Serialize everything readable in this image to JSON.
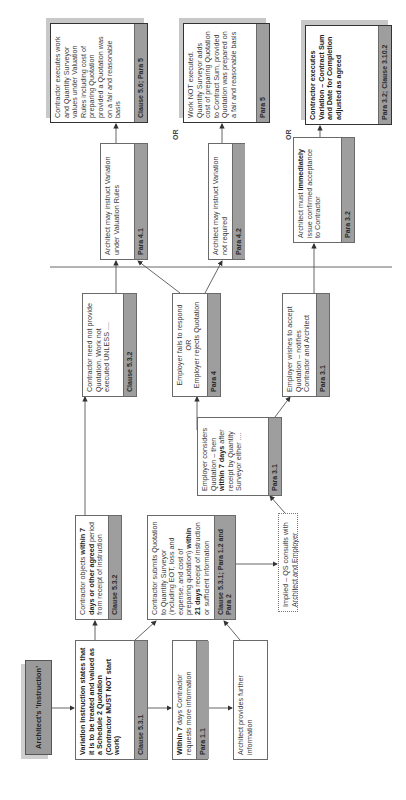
{
  "diagram": {
    "orientation": "rotated 90 degrees counter-clockwise",
    "start": {
      "label": "Architect's 'Instruction'"
    },
    "nodes": [
      {
        "id": "variation",
        "text_parts": [
          {
            "t": "Variation Instruction states that it is to be treated and valued as a Schedule 2 Quotation (Contractor MUST NOT start work)",
            "b": true
          }
        ],
        "tag": "Clause 5.3.1"
      },
      {
        "id": "objects",
        "text_parts": [
          {
            "t": "Contractor objects ",
            "b": false
          },
          {
            "t": "within 7 days or other agreed",
            "b": true
          },
          {
            "t": " period from receipt of instruction",
            "b": false
          }
        ],
        "tag": "Clause 5.3.2"
      },
      {
        "id": "within7",
        "text_parts": [
          {
            "t": "Within 7",
            "b": true
          },
          {
            "t": " days Contractor requests more information",
            "b": false
          }
        ],
        "tag": "Para 1.1"
      },
      {
        "id": "provides",
        "text_parts": [
          {
            "t": "Architect provides further information",
            "b": false
          }
        ],
        "tag": ""
      },
      {
        "id": "submits",
        "text_parts": [
          {
            "t": "Contractor submits Quotation to Quantity Surveyor (including EOT, loss and expense, and cost of preparing quotation) ",
            "b": false
          },
          {
            "t": "within 21 days",
            "b": true
          },
          {
            "t": " receipt of instruction or sufficient information",
            "b": false
          }
        ],
        "tag": "Clause 5.3.1; Para 1.2 and Para 2"
      },
      {
        "id": "implied",
        "text_parts": [
          {
            "t": "Implied – QS consults with Architect and Employer",
            "b": false
          }
        ],
        "tag": ""
      },
      {
        "id": "considers",
        "text_parts": [
          {
            "t": "Employer considers Quotation – then ",
            "b": false
          },
          {
            "t": "within 7 days",
            "b": true
          },
          {
            "t": " after receipt by Quantity Surveyor either ....",
            "b": false
          }
        ],
        "tag": "Para 3.1"
      },
      {
        "id": "neednot",
        "text_parts": [
          {
            "t": "Contractor need not provide Quotation. Work not executed UNLESS ....",
            "b": false
          }
        ],
        "tag": "Clause 5.3.2"
      },
      {
        "id": "fails",
        "text_parts": [
          {
            "t": "Employer fails to respond",
            "b": false
          },
          {
            "t": "OR",
            "b": false
          },
          {
            "t": "Employer rejects Quotation",
            "b": false
          }
        ],
        "tag": "Para 4"
      },
      {
        "id": "accept",
        "text_parts": [
          {
            "t": "Employer wishes to accept Quotation – notifies Contractor and Architect",
            "b": false
          }
        ],
        "tag": "Para 3.1"
      },
      {
        "id": "instruct41",
        "text_parts": [
          {
            "t": "Architect may instruct Variation under Valuation Rules",
            "b": false
          }
        ],
        "tag": "Para 4.1"
      },
      {
        "id": "instruct42",
        "text_parts": [
          {
            "t": "Architect may instruct Variation not required",
            "b": false
          }
        ],
        "tag": "Para 4.2"
      },
      {
        "id": "immediately",
        "text_parts": [
          {
            "t": "Architect must ",
            "b": false
          },
          {
            "t": "immediately",
            "b": true
          },
          {
            "t": " issue confirmed acceptance to Contractor",
            "b": false
          }
        ],
        "tag": "Para 3.2"
      },
      {
        "id": "executes56",
        "text_parts": [
          {
            "t": "Contractor executes work and Quantity Surveyor values under Valuation Rules including cost of preparing Quotation provided a Quotation was on a fair and reasonable basis",
            "b": false
          }
        ],
        "tag": "Clause 5.6; Para 5"
      },
      {
        "id": "notexecuted",
        "text_parts": [
          {
            "t": "Work NOT executed. Quantity Surveyor adds cost of preparing Quotation to Contract Sum, provided Quotation was prepared on a fair and reasonable basis",
            "b": false
          }
        ],
        "tag": "Para 5"
      },
      {
        "id": "executesvar",
        "text_parts": [
          {
            "t": "Contractor executes Variation – Contract Sum and Date for Completion adjusted as agreed",
            "b": true
          }
        ],
        "tag": "Para 3.2; Clause 3.10.2"
      }
    ],
    "or_labels": [
      "OR",
      "OR"
    ]
  }
}
